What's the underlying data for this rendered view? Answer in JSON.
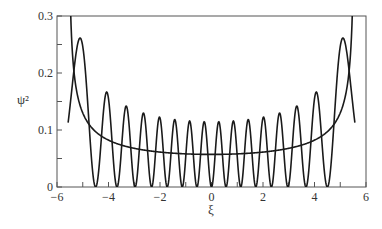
{
  "chart_data": {
    "type": "line",
    "title": "",
    "xlabel": "ξ",
    "ylabel": "ψ²",
    "xlim": [
      -6,
      6
    ],
    "ylim": [
      0,
      0.3
    ],
    "grid": false,
    "legend": null,
    "x_ticks": [
      -6,
      -4,
      -2,
      0,
      2,
      4,
      6
    ],
    "x_tick_labels": [
      "−6",
      "−4",
      "−2",
      "0",
      "2",
      "4",
      "6"
    ],
    "x_minor_ticks": [
      -5,
      -3,
      -1,
      1,
      3,
      5
    ],
    "y_ticks": [
      0,
      0.1,
      0.2,
      0.3
    ],
    "y_tick_labels": [
      "0",
      "0.1",
      "0.2",
      "0.3"
    ],
    "y_minor_ticks": [
      0.05,
      0.15,
      0.25
    ],
    "series": [
      {
        "name": "quantum probability density |ψ_15(ξ)|²",
        "kind": "harmonic_oscillator_quantum",
        "n": 15,
        "domain": [
          -5.568,
          5.568
        ],
        "key_points": {
          "peaks": [
            {
              "x": -5.1,
              "y": 0.26
            },
            {
              "x": -4.1,
              "y": 0.165
            },
            {
              "x": -3.3,
              "y": 0.14
            },
            {
              "x": -2.6,
              "y": 0.128
            },
            {
              "x": -1.95,
              "y": 0.12
            },
            {
              "x": -1.35,
              "y": 0.116
            },
            {
              "x": -0.8,
              "y": 0.114
            },
            {
              "x": -0.25,
              "y": 0.113
            },
            {
              "x": 0.25,
              "y": 0.113
            },
            {
              "x": 0.8,
              "y": 0.114
            },
            {
              "x": 1.35,
              "y": 0.116
            },
            {
              "x": 1.95,
              "y": 0.12
            },
            {
              "x": 2.6,
              "y": 0.128
            },
            {
              "x": 3.3,
              "y": 0.14
            },
            {
              "x": 4.1,
              "y": 0.165
            },
            {
              "x": 5.1,
              "y": 0.26
            }
          ],
          "zeros": [
            -4.5,
            -3.6,
            -2.9,
            -2.25,
            -1.65,
            -1.05,
            -0.5,
            0,
            0.5,
            1.05,
            1.65,
            2.25,
            2.9,
            3.6,
            4.5
          ],
          "endpoints": [
            {
              "x": -5.57,
              "y": 0.117
            },
            {
              "x": 5.57,
              "y": 0.117
            }
          ]
        }
      },
      {
        "name": "classical probability density 1/(π√(A²−ξ²))",
        "kind": "harmonic_oscillator_classical",
        "amplitude": 5.568,
        "key_points": [
          {
            "x": -5.5,
            "y": 0.3
          },
          {
            "x": -5.0,
            "y": 0.13
          },
          {
            "x": -4.0,
            "y": 0.082
          },
          {
            "x": -2.0,
            "y": 0.061
          },
          {
            "x": 0,
            "y": 0.057
          },
          {
            "x": 2.0,
            "y": 0.061
          },
          {
            "x": 4.0,
            "y": 0.082
          },
          {
            "x": 5.0,
            "y": 0.13
          },
          {
            "x": 5.5,
            "y": 0.3
          }
        ]
      }
    ],
    "colors": {
      "curve": "#1a1a1a",
      "frame": "#555555",
      "text": "#333333"
    }
  }
}
